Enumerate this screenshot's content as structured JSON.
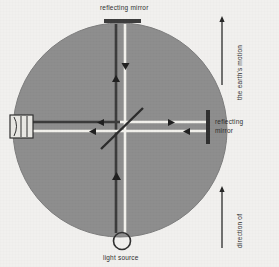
{
  "figure": {
    "background_color": "#f1f0ee",
    "apparatus_color": "#8d8d8d",
    "beam_dark_color": "#3b3b3b",
    "beam_light_color": "#f4f4f0",
    "text_color": "#2e2e2e"
  },
  "labels": {
    "top_mirror": "reflecting mirror",
    "right_mirror_line1": "reflecting",
    "right_mirror_line2": "mirror",
    "earth_motion": "the earth's motion",
    "direction_of": "direction of",
    "light_source": "light source"
  },
  "components": {
    "platform": {
      "name": "circular rotating platform",
      "cx": 120,
      "cy": 130,
      "r": 107
    },
    "top_mirror": {
      "name": "top reflecting mirror",
      "x": 105,
      "y": 20,
      "width": 36,
      "height": 4
    },
    "right_mirror": {
      "name": "right reflecting mirror",
      "x": 208,
      "y": 110,
      "width": 4,
      "height": 34
    },
    "beam_splitter": {
      "name": "half-silvered beam splitter",
      "angle_deg": -45
    },
    "telescope": {
      "name": "observer telescope / eyepiece",
      "x": 10,
      "y": 115,
      "width": 22,
      "height": 22
    },
    "light_source": {
      "name": "light source lamp",
      "cx": 123,
      "cy": 241,
      "r": 8
    }
  },
  "arrows": {
    "earth_motion": "up",
    "direction_of": "up",
    "vertical_beam_down": "down",
    "vertical_beam_up": "up",
    "vertical_lower_up": "up",
    "right_beam_out": "right",
    "right_beam_return": "left",
    "left_beam_out": "left",
    "left_beam_return": "left"
  }
}
